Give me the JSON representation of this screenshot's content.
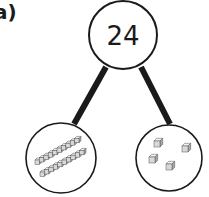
{
  "question_label": "a)",
  "whole": "24",
  "parts": [
    {
      "name": "tens",
      "rods": 2,
      "cubes_per_rod": 10
    },
    {
      "name": "ones",
      "cubes": 4
    }
  ],
  "colors": {
    "ink": "#1a1a1a",
    "cube_fill": "#d8d8d8",
    "cube_top": "#f2f2f2",
    "cube_side": "#a8a8a8"
  }
}
